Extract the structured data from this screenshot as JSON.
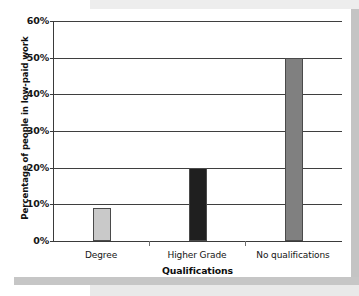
{
  "chart_data": {
    "type": "bar",
    "title": "",
    "xlabel": "Qualifications",
    "ylabel": "Percentage of people in low-paid work",
    "categories": [
      "Degree",
      "Higher Grade",
      "No qualifications"
    ],
    "values": [
      9,
      20,
      50
    ],
    "value_unit": "%",
    "ylim": [
      0,
      60
    ],
    "ytick_values": [
      0,
      10,
      20,
      30,
      40,
      50,
      60
    ],
    "ytick_labels": [
      "0%",
      "10%",
      "20%",
      "30%",
      "40%",
      "50%",
      "60%"
    ],
    "grid": "horizontal",
    "legend": "none",
    "bar_colors": [
      "#c9c9c9",
      "#1f1f1f",
      "#808080"
    ],
    "bar_edge_color": "#4a4a4a",
    "axis_color": "#3a3a3a",
    "background": "#ffffff"
  },
  "decor": {
    "band_color_light": "#ededed",
    "band_color_dark": "#c4c4c4"
  }
}
